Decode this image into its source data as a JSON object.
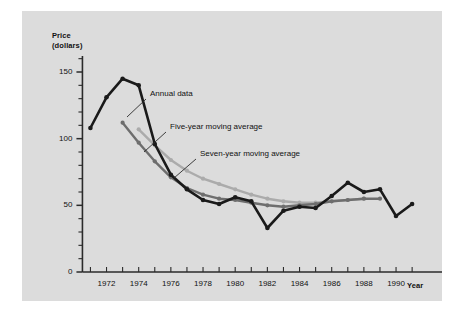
{
  "chart_data": {
    "type": "line",
    "title": "",
    "xlabel": "Year",
    "ylabel": "Price\n(dollars)",
    "xlim": [
      1970.6,
      1991.8
    ],
    "ylim": [
      0,
      162
    ],
    "grid": false,
    "legend_position": "inline-annotations",
    "y_ticks_major": [
      0,
      50,
      100,
      150
    ],
    "y_tick_labels": [
      "0",
      "50",
      "100",
      "150"
    ],
    "y_ticks_minor": [
      10,
      20,
      30,
      40,
      60,
      70,
      80,
      90,
      110,
      120,
      130,
      140,
      160
    ],
    "x_ticks": [
      1971,
      1972,
      1973,
      1974,
      1975,
      1976,
      1977,
      1978,
      1979,
      1980,
      1981,
      1982,
      1983,
      1984,
      1985,
      1986,
      1987,
      1988,
      1989,
      1990,
      1991
    ],
    "x_tick_labels_shown": [
      "1972",
      "1974",
      "1976",
      "1978",
      "1980",
      "1982",
      "1984",
      "1986",
      "1988",
      "1990"
    ],
    "x_tick_label_values": [
      1972,
      1974,
      1976,
      1978,
      1980,
      1982,
      1984,
      1986,
      1988,
      1990
    ],
    "series": [
      {
        "name": "Annual data",
        "color": "#1a1a1a",
        "marker": "circle",
        "x": [
          1971,
          1972,
          1973,
          1974,
          1975,
          1976,
          1977,
          1978,
          1979,
          1980,
          1981,
          1982,
          1983,
          1984,
          1985,
          1986,
          1987,
          1988,
          1989,
          1990,
          1991
        ],
        "values": [
          108,
          131,
          145,
          140,
          96,
          73,
          62,
          54,
          51,
          56,
          53,
          33,
          46,
          49,
          48,
          57,
          67,
          60,
          62,
          42,
          51
        ]
      },
      {
        "name": "Five-year moving average",
        "color": "#6e6e6e",
        "marker": "circle",
        "x": [
          1973,
          1974,
          1975,
          1976,
          1977,
          1978,
          1979,
          1980,
          1981,
          1982,
          1983,
          1984,
          1985,
          1986,
          1987,
          1988,
          1989
        ],
        "values": [
          112,
          97,
          83,
          71,
          63,
          58,
          55,
          54,
          52,
          50,
          49,
          50,
          51,
          53,
          54,
          55,
          55
        ]
      },
      {
        "name": "Seven-year moving average",
        "color": "#ababab",
        "marker": "circle",
        "x": [
          1974,
          1975,
          1976,
          1977,
          1978,
          1979,
          1980,
          1981,
          1982,
          1983,
          1984,
          1985,
          1986,
          1987,
          1988
        ],
        "values": [
          107,
          95,
          84,
          76,
          70,
          66,
          62,
          58,
          55,
          53,
          52,
          52,
          53,
          54,
          55
        ]
      }
    ],
    "annotations": [
      {
        "text": "Annual data",
        "label_x": 128,
        "label_y": 83,
        "leader_from_x": 124,
        "leader_from_y": 88,
        "leader_to_x": 105,
        "leader_to_y": 106
      },
      {
        "text": "Five-year moving average",
        "label_x": 148,
        "label_y": 116,
        "leader_from_x": 144,
        "leader_from_y": 121,
        "leader_to_x": 122,
        "leader_to_y": 141
      },
      {
        "text": "Seven-year moving average",
        "label_x": 178,
        "label_y": 143,
        "leader_from_x": 174,
        "leader_from_y": 148,
        "leader_to_x": 152,
        "leader_to_y": 167
      }
    ]
  }
}
